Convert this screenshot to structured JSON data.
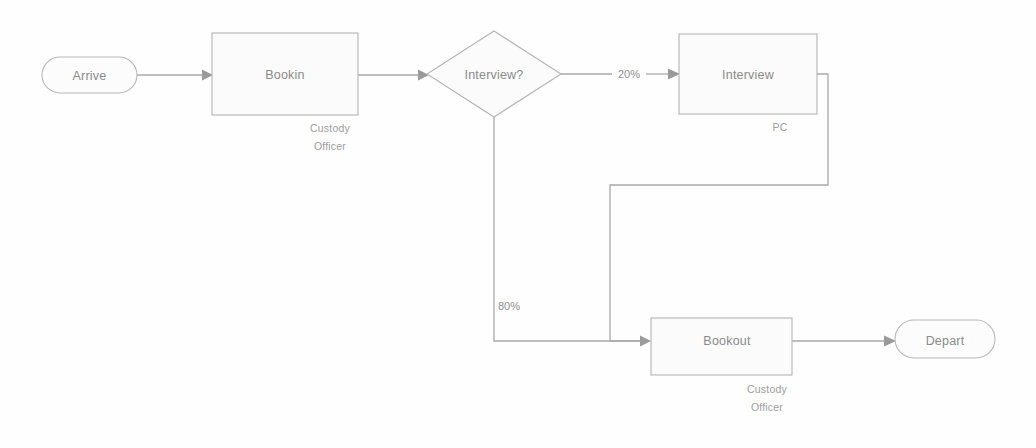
{
  "diagram": {
    "type": "flowchart",
    "canvas": {
      "width": 1036,
      "height": 448,
      "background": "#fefefe"
    },
    "colors": {
      "shape_fill": "#fbfbfb",
      "shape_stroke": "#b4b4b4",
      "connector": "#a9a9a9",
      "text": "#8a8a8a",
      "resource_text": "#9d9d9d"
    },
    "nodes": [
      {
        "id": "arrive",
        "shape": "pill",
        "label": "Arrive",
        "resource": "",
        "x": 42,
        "y": 57,
        "w": 95,
        "h": 36
      },
      {
        "id": "bookin",
        "shape": "rect",
        "label": "Bookin",
        "resource_line1": "Custody",
        "resource_line2": "Officer",
        "x": 212,
        "y": 33,
        "w": 146,
        "h": 82
      },
      {
        "id": "interview_decision",
        "shape": "diamond",
        "label": "Interview?",
        "resource": "",
        "cx": 494,
        "cy": 74,
        "w": 133,
        "h": 86
      },
      {
        "id": "interview",
        "shape": "rect",
        "label": "Interview",
        "resource_line1": "PC",
        "resource_line2": "",
        "x": 679,
        "y": 34,
        "w": 138,
        "h": 80
      },
      {
        "id": "bookout",
        "shape": "rect",
        "label": "Bookout",
        "resource_line1": "Custody",
        "resource_line2": "Officer",
        "x": 651,
        "y": 318,
        "w": 141,
        "h": 57
      },
      {
        "id": "depart",
        "shape": "pill",
        "label": "Depart",
        "resource": "",
        "x": 895,
        "y": 320,
        "w": 100,
        "h": 38
      }
    ],
    "edges": [
      {
        "id": "arrive-to-bookin",
        "from": "arrive",
        "to": "bookin",
        "label": ""
      },
      {
        "id": "bookin-to-decision",
        "from": "bookin",
        "to": "interview_decision",
        "label": ""
      },
      {
        "id": "decision-to-interview",
        "from": "interview_decision",
        "to": "interview",
        "label": "20%"
      },
      {
        "id": "decision-to-bookout",
        "from": "interview_decision",
        "to": "bookout",
        "label": "80%"
      },
      {
        "id": "interview-to-bookout",
        "from": "interview",
        "to": "bookout",
        "label": ""
      },
      {
        "id": "bookout-to-depart",
        "from": "bookout",
        "to": "depart",
        "label": ""
      }
    ],
    "edge_labels": {
      "yes_branch": "20%",
      "no_branch": "80%"
    }
  }
}
